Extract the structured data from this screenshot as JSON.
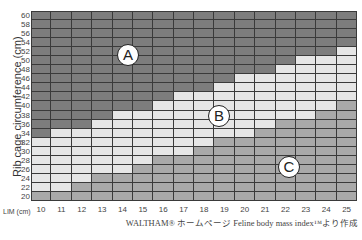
{
  "chart_data": {
    "type": "heatmap",
    "title": "",
    "xlabel": "LIM (cm)",
    "ylabel": "Rib cage circumference (cm)",
    "x": [
      10,
      11,
      12,
      13,
      14,
      15,
      16,
      17,
      18,
      19,
      20,
      21,
      22,
      23,
      24,
      25
    ],
    "y_ticks": [
      20,
      22,
      24,
      26,
      28,
      30,
      32,
      34,
      36,
      38,
      40,
      42,
      44,
      46,
      48,
      50,
      52,
      54,
      56,
      58,
      60
    ],
    "ylim": [
      20,
      60
    ],
    "xlim": [
      10,
      25
    ],
    "zones": [
      {
        "name": "A",
        "color": "#7d7d7d",
        "description": "dark region (upper-left)"
      },
      {
        "name": "B",
        "color": "#e6e6e6",
        "description": "light region (diagonal band)"
      },
      {
        "name": "C",
        "color": "#a9a9a9",
        "description": "medium region (lower-right)"
      }
    ],
    "b_band_top_cm": [
      32,
      34,
      34,
      36,
      38,
      38,
      40,
      42,
      42,
      44,
      46,
      46,
      48,
      50,
      50,
      52
    ],
    "c_zone_top_cm": [
      20,
      20,
      22,
      24,
      24,
      26,
      28,
      28,
      30,
      32,
      32,
      34,
      36,
      36,
      38,
      40
    ],
    "grid": true,
    "legend": "circled letters A, B, C placed inside zones",
    "annotations": [
      "A",
      "B",
      "C"
    ],
    "source": "WALTHAM® ホームページ Feline body mass index™より作成"
  },
  "labels": {
    "ylabel": "Rib cage circumference (cm)",
    "xunit": "LIM (cm)",
    "zone_a": "A",
    "zone_b": "B",
    "zone_c": "C",
    "source": "WALTHAM® ホームページ Feline body mass index™より作成"
  },
  "layout": {
    "grid_left": 31,
    "grid_top": 11,
    "grid_width": 326,
    "grid_height": 190,
    "label_positions": {
      "A": [
        128,
        55
      ],
      "B": [
        219,
        116
      ],
      "C": [
        289,
        167
      ]
    }
  }
}
